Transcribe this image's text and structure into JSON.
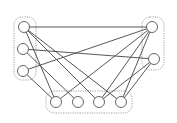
{
  "diagram": {
    "type": "bipartite-graph",
    "groups": [
      {
        "id": "left",
        "x": 14,
        "y": 17,
        "w": 22,
        "h": 63,
        "r": 8
      },
      {
        "id": "right",
        "x": 142,
        "y": 17,
        "w": 22,
        "h": 53,
        "r": 8
      },
      {
        "id": "bottom",
        "x": 46,
        "y": 91,
        "w": 86,
        "h": 22,
        "r": 8
      }
    ],
    "nodes": [
      {
        "id": "L1",
        "x": 24,
        "y": 27,
        "r": 5.5
      },
      {
        "id": "L2",
        "x": 23,
        "y": 49,
        "r": 5.5
      },
      {
        "id": "L3",
        "x": 23,
        "y": 71,
        "r": 5.5
      },
      {
        "id": "R1",
        "x": 152,
        "y": 27,
        "r": 5.5
      },
      {
        "id": "R2",
        "x": 154,
        "y": 59,
        "r": 5.5
      },
      {
        "id": "B1",
        "x": 56,
        "y": 102,
        "r": 5.5
      },
      {
        "id": "B2",
        "x": 78,
        "y": 102,
        "r": 5.5
      },
      {
        "id": "B3",
        "x": 99,
        "y": 102,
        "r": 5.5
      },
      {
        "id": "B4",
        "x": 121,
        "y": 102,
        "r": 5.5
      }
    ],
    "edges": [
      [
        "L1",
        "R1"
      ],
      [
        "L1",
        "B1"
      ],
      [
        "L1",
        "B3"
      ],
      [
        "L1",
        "B4"
      ],
      [
        "L2",
        "R2"
      ],
      [
        "L2",
        "B2"
      ],
      [
        "L3",
        "R1"
      ],
      [
        "L3",
        "B1"
      ],
      [
        "R1",
        "B1"
      ],
      [
        "R1",
        "B3"
      ],
      [
        "R1",
        "B4"
      ],
      [
        "R2",
        "B3"
      ],
      [
        "R2",
        "B4"
      ]
    ]
  }
}
